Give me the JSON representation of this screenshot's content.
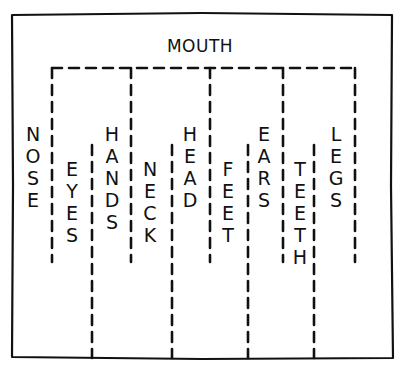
{
  "diagram": {
    "title": "MOUTH",
    "colors": {
      "ink": "#111111",
      "background": "#ffffff"
    },
    "frame": {
      "x1": 12,
      "y1": 14,
      "x2": 392,
      "y2": 358
    },
    "top_bracket": {
      "y": 68,
      "x1": 52,
      "x2": 355
    },
    "dividers_from_top": [
      {
        "x": 52,
        "y1": 68,
        "y2": 262
      },
      {
        "x": 131,
        "y1": 68,
        "y2": 262
      },
      {
        "x": 210,
        "y1": 68,
        "y2": 262
      },
      {
        "x": 283,
        "y1": 68,
        "y2": 262
      },
      {
        "x": 355,
        "y1": 68,
        "y2": 262
      }
    ],
    "dividers_from_bottom": [
      {
        "x": 92,
        "y1": 145,
        "y2": 358
      },
      {
        "x": 172,
        "y1": 145,
        "y2": 358
      },
      {
        "x": 248,
        "y1": 145,
        "y2": 358
      },
      {
        "x": 314,
        "y1": 145,
        "y2": 358
      }
    ],
    "words": [
      {
        "label": "NOSE",
        "x": 33,
        "y": 141
      },
      {
        "label": "EYES",
        "x": 72,
        "y": 176
      },
      {
        "label": "HANDS",
        "x": 112,
        "y": 141
      },
      {
        "label": "NECK",
        "x": 150,
        "y": 176
      },
      {
        "label": "HEAD",
        "x": 190,
        "y": 141
      },
      {
        "label": "FEET",
        "x": 228,
        "y": 176
      },
      {
        "label": "EARS",
        "x": 264,
        "y": 141
      },
      {
        "label": "TEETH",
        "x": 300,
        "y": 176
      },
      {
        "label": "LEGS",
        "x": 336,
        "y": 141
      }
    ],
    "letter_spacing": 22
  }
}
